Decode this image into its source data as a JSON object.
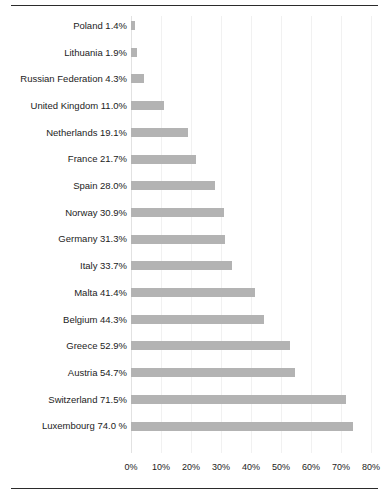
{
  "document": {
    "title_remnant": "",
    "rule_color": "#2b2b2b"
  },
  "chart_data": {
    "type": "bar",
    "orientation": "horizontal",
    "title": "",
    "xlabel": "",
    "ylabel": "",
    "xlim": [
      0,
      80
    ],
    "grid": true,
    "legend": false,
    "bar_color": "#b3b3b3",
    "xticks": [
      "0%",
      "10%",
      "20%",
      "30%",
      "40%",
      "50%",
      "60%",
      "70%",
      "80%"
    ],
    "xtick_values": [
      0,
      10,
      20,
      30,
      40,
      50,
      60,
      70,
      80
    ],
    "categories": [
      "Poland",
      "Lithuania",
      "Russian Federation",
      "United Kingdom",
      "Netherlands",
      "France",
      "Spain",
      "Norway",
      "Germany",
      "Italy",
      "Malta",
      "Belgium",
      "Greece",
      "Austria",
      "Switzerland",
      "Luxembourg"
    ],
    "values": [
      1.4,
      1.9,
      4.3,
      11.0,
      19.1,
      21.7,
      28.0,
      30.9,
      31.3,
      33.7,
      41.4,
      44.3,
      52.9,
      54.7,
      71.5,
      74.0
    ],
    "labels": [
      "Poland 1.4%",
      "Lithuania 1.9%",
      "Russian Federation 4.3%",
      "United Kingdom 11.0%",
      "Netherlands 19.1%",
      "France 21.7%",
      "Spain 28.0%",
      "Norway 30.9%",
      "Germany 31.3%",
      "Italy 33.7%",
      "Malta 41.4%",
      "Belgium 44.3%",
      "Greece 52.9%",
      "Austria 54.7%",
      "Switzerland 71.5%",
      "Luxembourg 74.0 %"
    ]
  }
}
